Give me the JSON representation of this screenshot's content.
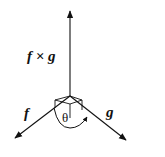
{
  "diagram": {
    "type": "vector-cross-product",
    "origin": [
      70,
      96
    ],
    "vectors": [
      {
        "id": "cross",
        "label": "f × g",
        "tip": [
          70,
          10
        ]
      },
      {
        "id": "f",
        "label": "f",
        "tip": [
          14,
          139
        ]
      },
      {
        "id": "g",
        "label": "g",
        "tip": [
          127,
          141
        ]
      }
    ],
    "angle_label": "θ",
    "labels": {
      "cross": "f × g",
      "f": "f",
      "g": "g",
      "theta": "θ"
    },
    "colors": {
      "stroke": "#111111",
      "background": "#ffffff"
    }
  }
}
